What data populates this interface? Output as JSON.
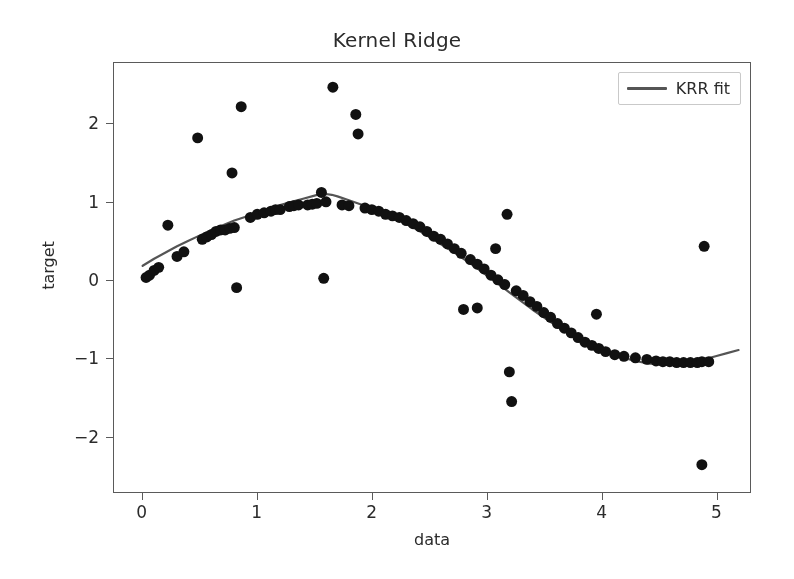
{
  "figure": {
    "width": 794,
    "height": 579,
    "background": "#ffffff",
    "axes_color": "#5a5a5a",
    "text_color": "#2b2b2b"
  },
  "legend": {
    "label": "KRR fit",
    "line_color": "#555555",
    "position": "upper right"
  },
  "chart_data": {
    "type": "scatter",
    "title": "Kernel Ridge",
    "xlabel": "data",
    "ylabel": "target",
    "xlim": [
      -0.25,
      5.3
    ],
    "ylim": [
      -2.72,
      2.78
    ],
    "xticks": [
      0,
      1,
      2,
      3,
      4,
      5
    ],
    "xticklabels": [
      "0",
      "1",
      "2",
      "3",
      "4",
      "5"
    ],
    "yticks": [
      -2,
      -1,
      0,
      1,
      2
    ],
    "yticklabels": [
      "−2",
      "−1",
      "0",
      "1",
      "2"
    ],
    "grid": false,
    "marker_color": "#111111",
    "marker_size": 11,
    "series": [
      {
        "name": "training data",
        "type": "scatter",
        "points": [
          [
            0.03,
            0.03
          ],
          [
            0.06,
            0.06
          ],
          [
            0.1,
            0.12
          ],
          [
            0.14,
            0.16
          ],
          [
            0.22,
            0.7
          ],
          [
            0.3,
            0.3
          ],
          [
            0.36,
            0.36
          ],
          [
            0.48,
            1.82
          ],
          [
            0.52,
            0.52
          ],
          [
            0.56,
            0.55
          ],
          [
            0.6,
            0.58
          ],
          [
            0.64,
            0.62
          ],
          [
            0.68,
            0.64
          ],
          [
            0.72,
            0.64
          ],
          [
            0.76,
            0.66
          ],
          [
            0.8,
            0.67
          ],
          [
            0.78,
            1.37
          ],
          [
            0.82,
            -0.1
          ],
          [
            0.86,
            2.22
          ],
          [
            0.94,
            0.8
          ],
          [
            1.0,
            0.84
          ],
          [
            1.06,
            0.86
          ],
          [
            1.12,
            0.88
          ],
          [
            1.16,
            0.9
          ],
          [
            1.2,
            0.9
          ],
          [
            1.28,
            0.94
          ],
          [
            1.32,
            0.95
          ],
          [
            1.36,
            0.96
          ],
          [
            1.44,
            0.96
          ],
          [
            1.48,
            0.97
          ],
          [
            1.52,
            0.98
          ],
          [
            1.56,
            1.12
          ],
          [
            1.58,
            0.02
          ],
          [
            1.6,
            1.0
          ],
          [
            1.66,
            2.47
          ],
          [
            1.74,
            0.96
          ],
          [
            1.8,
            0.95
          ],
          [
            1.86,
            2.12
          ],
          [
            1.88,
            1.87
          ],
          [
            1.94,
            0.92
          ],
          [
            2.0,
            0.9
          ],
          [
            2.06,
            0.88
          ],
          [
            2.12,
            0.84
          ],
          [
            2.18,
            0.82
          ],
          [
            2.24,
            0.8
          ],
          [
            2.3,
            0.76
          ],
          [
            2.36,
            0.72
          ],
          [
            2.42,
            0.68
          ],
          [
            2.48,
            0.62
          ],
          [
            2.54,
            0.56
          ],
          [
            2.6,
            0.52
          ],
          [
            2.66,
            0.46
          ],
          [
            2.72,
            0.4
          ],
          [
            2.78,
            0.34
          ],
          [
            2.8,
            -0.38
          ],
          [
            2.92,
            -0.36
          ],
          [
            2.86,
            0.26
          ],
          [
            2.92,
            0.2
          ],
          [
            2.98,
            0.14
          ],
          [
            3.04,
            0.06
          ],
          [
            3.08,
            0.4
          ],
          [
            3.1,
            0.0
          ],
          [
            3.16,
            -0.06
          ],
          [
            3.18,
            0.84
          ],
          [
            3.2,
            -1.18
          ],
          [
            3.22,
            -1.56
          ],
          [
            3.26,
            -0.14
          ],
          [
            3.32,
            -0.2
          ],
          [
            3.38,
            -0.28
          ],
          [
            3.44,
            -0.34
          ],
          [
            3.5,
            -0.42
          ],
          [
            3.56,
            -0.48
          ],
          [
            3.62,
            -0.56
          ],
          [
            3.68,
            -0.62
          ],
          [
            3.74,
            -0.68
          ],
          [
            3.8,
            -0.74
          ],
          [
            3.86,
            -0.8
          ],
          [
            3.92,
            -0.84
          ],
          [
            3.96,
            -0.44
          ],
          [
            3.98,
            -0.88
          ],
          [
            4.04,
            -0.92
          ],
          [
            4.12,
            -0.96
          ],
          [
            4.2,
            -0.98
          ],
          [
            4.3,
            -1.0
          ],
          [
            4.4,
            -1.02
          ],
          [
            4.48,
            -1.04
          ],
          [
            4.54,
            -1.05
          ],
          [
            4.6,
            -1.05
          ],
          [
            4.66,
            -1.06
          ],
          [
            4.72,
            -1.06
          ],
          [
            4.78,
            -1.06
          ],
          [
            4.84,
            -1.06
          ],
          [
            4.88,
            -1.05
          ],
          [
            4.94,
            -1.05
          ],
          [
            4.9,
            0.43
          ],
          [
            4.88,
            -2.37
          ]
        ]
      },
      {
        "name": "KRR fit",
        "type": "line",
        "color": "#555555",
        "linewidth": 2.2,
        "points": [
          [
            0.0,
            0.18
          ],
          [
            0.1,
            0.27
          ],
          [
            0.2,
            0.35
          ],
          [
            0.3,
            0.43
          ],
          [
            0.4,
            0.5
          ],
          [
            0.5,
            0.57
          ],
          [
            0.6,
            0.64
          ],
          [
            0.7,
            0.7
          ],
          [
            0.8,
            0.76
          ],
          [
            0.9,
            0.81
          ],
          [
            1.0,
            0.86
          ],
          [
            1.1,
            0.91
          ],
          [
            1.2,
            0.96
          ],
          [
            1.3,
            1.0
          ],
          [
            1.4,
            1.04
          ],
          [
            1.5,
            1.08
          ],
          [
            1.55,
            1.1
          ],
          [
            1.6,
            1.1
          ],
          [
            1.65,
            1.09
          ],
          [
            1.7,
            1.07
          ],
          [
            1.8,
            1.02
          ],
          [
            1.9,
            0.97
          ],
          [
            2.0,
            0.92
          ],
          [
            2.1,
            0.86
          ],
          [
            2.2,
            0.8
          ],
          [
            2.3,
            0.72
          ],
          [
            2.4,
            0.64
          ],
          [
            2.5,
            0.55
          ],
          [
            2.6,
            0.46
          ],
          [
            2.7,
            0.37
          ],
          [
            2.8,
            0.27
          ],
          [
            2.9,
            0.17
          ],
          [
            3.0,
            0.06
          ],
          [
            3.1,
            -0.05
          ],
          [
            3.2,
            -0.16
          ],
          [
            3.3,
            -0.27
          ],
          [
            3.4,
            -0.38
          ],
          [
            3.5,
            -0.48
          ],
          [
            3.6,
            -0.58
          ],
          [
            3.7,
            -0.67
          ],
          [
            3.8,
            -0.75
          ],
          [
            3.9,
            -0.83
          ],
          [
            4.0,
            -0.9
          ],
          [
            4.1,
            -0.96
          ],
          [
            4.2,
            -1.0
          ],
          [
            4.3,
            -1.04
          ],
          [
            4.4,
            -1.07
          ],
          [
            4.5,
            -1.08
          ],
          [
            4.6,
            -1.09
          ],
          [
            4.7,
            -1.08
          ],
          [
            4.8,
            -1.06
          ],
          [
            4.9,
            -1.02
          ],
          [
            5.0,
            -0.98
          ],
          [
            5.1,
            -0.94
          ],
          [
            5.2,
            -0.9
          ]
        ]
      }
    ]
  }
}
